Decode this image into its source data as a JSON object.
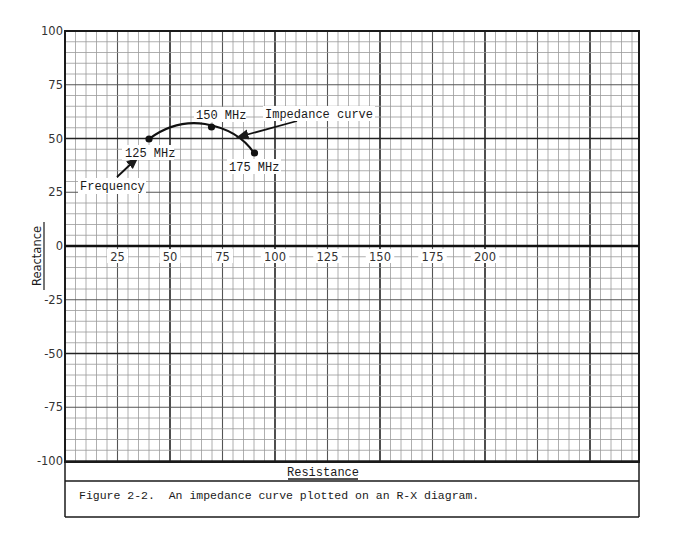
{
  "figure": {
    "caption": "Figure 2-2.  An impedance curve plotted on an R-X diagram.",
    "xlabel": "Resistance",
    "ylabel": "Reactance"
  },
  "annotations": {
    "impedance_curve": "Impedance curve",
    "frequency": "Frequency",
    "p125": "125 MHz",
    "p150": "150 MHz",
    "p175": "175 MHz"
  },
  "axes": {
    "x_ticks": [
      "25",
      "50",
      "75",
      "100",
      "125",
      "150",
      "175",
      "200"
    ],
    "y_ticks": [
      "100",
      "75",
      "50",
      "25",
      "0",
      "-25",
      "-50",
      "-75",
      "-100"
    ]
  },
  "colors": {
    "ink": "#1a1a1a",
    "grid_minor": "#9a9a9a",
    "grid_medium": "#555555",
    "grid_major": "#222222",
    "paper": "#ffffff"
  },
  "chart_data": {
    "type": "line",
    "title": "Figure 2-2. An impedance curve plotted on an R-X diagram.",
    "xlabel": "Resistance",
    "ylabel": "Reactance",
    "xlim": [
      0,
      273
    ],
    "ylim": [
      -100,
      100
    ],
    "grid": true,
    "grid_minor_step": 5,
    "grid_medium_step": 25,
    "grid_major_step_x": 50,
    "grid_major_step_y": 50,
    "x_ticks": [
      25,
      50,
      75,
      100,
      125,
      150,
      175,
      200
    ],
    "y_ticks": [
      100,
      75,
      50,
      25,
      0,
      -25,
      -50,
      -75,
      -100
    ],
    "series": [
      {
        "name": "Impedance curve",
        "points": [
          {
            "frequency": "125 MHz",
            "R": 40,
            "X": 50
          },
          {
            "frequency": "150 MHz",
            "R": 70,
            "X": 55
          },
          {
            "frequency": "175 MHz",
            "R": 90,
            "X": 43
          }
        ],
        "curve_apex": {
          "R": 61,
          "X": 57
        }
      }
    ],
    "annotations": [
      {
        "text": "Impedance curve",
        "arrow_to": {
          "R": 83,
          "X": 51
        }
      },
      {
        "text": "Frequency",
        "arrow_direction": "increasing along curve"
      },
      {
        "text": "125 MHz",
        "at": {
          "R": 40,
          "X": 50
        }
      },
      {
        "text": "150 MHz",
        "at": {
          "R": 70,
          "X": 55
        }
      },
      {
        "text": "175 MHz",
        "at": {
          "R": 90,
          "X": 43
        }
      }
    ]
  }
}
